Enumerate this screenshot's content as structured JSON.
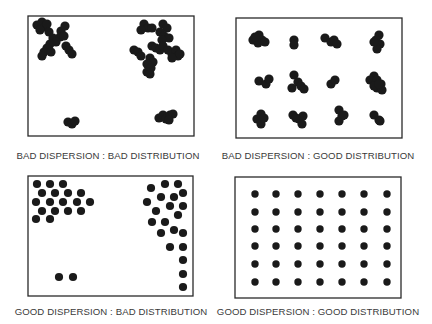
{
  "figure": {
    "colors": {
      "dot": "#1a1a1a",
      "frame": "#2a2a2a",
      "label": "#3a3a3a",
      "background": "#ffffff"
    },
    "panels": [
      {
        "id": "bad-dispersion-bad-distribution",
        "label": "BAD DISPERSION  :  BAD DISTRIBUTION",
        "label_pos": {
          "x": 108,
          "y": 150
        },
        "frame": {
          "x": 28,
          "y": 16,
          "w": 166,
          "h": 120
        },
        "dot_r": 4.6,
        "dots": [
          [
            37,
            25
          ],
          [
            42,
            22
          ],
          [
            45,
            27
          ],
          [
            40,
            30
          ],
          [
            47,
            24
          ],
          [
            49,
            32
          ],
          [
            61,
            31
          ],
          [
            65,
            26
          ],
          [
            60,
            37
          ],
          [
            64,
            36
          ],
          [
            53,
            38
          ],
          [
            56,
            42
          ],
          [
            50,
            44
          ],
          [
            47,
            48
          ],
          [
            44,
            52
          ],
          [
            51,
            52
          ],
          [
            42,
            56
          ],
          [
            66,
            46
          ],
          [
            69,
            50
          ],
          [
            72,
            54
          ],
          [
            144,
            24
          ],
          [
            148,
            28
          ],
          [
            152,
            28
          ],
          [
            141,
            30
          ],
          [
            163,
            24
          ],
          [
            167,
            28
          ],
          [
            160,
            32
          ],
          [
            164,
            36
          ],
          [
            169,
            38
          ],
          [
            162,
            40
          ],
          [
            134,
            50
          ],
          [
            138,
            52
          ],
          [
            141,
            56
          ],
          [
            152,
            46
          ],
          [
            156,
            48
          ],
          [
            160,
            50
          ],
          [
            163,
            46
          ],
          [
            168,
            50
          ],
          [
            172,
            54
          ],
          [
            176,
            50
          ],
          [
            178,
            56
          ],
          [
            172,
            58
          ],
          [
            180,
            54
          ],
          [
            150,
            58
          ],
          [
            153,
            62
          ],
          [
            147,
            64
          ],
          [
            151,
            68
          ],
          [
            147,
            72
          ],
          [
            150,
            74
          ],
          [
            68,
            122
          ],
          [
            72,
            124
          ],
          [
            75,
            121
          ],
          [
            159,
            118
          ],
          [
            163,
            115
          ],
          [
            166,
            119
          ],
          [
            170,
            115
          ],
          [
            173,
            114
          ],
          [
            169,
            120
          ]
        ]
      },
      {
        "id": "bad-dispersion-good-distribution",
        "label": "BAD DISPERSION  :  GOOD DISTRIBUTION",
        "label_pos": {
          "x": 318,
          "y": 150
        },
        "frame": {
          "x": 236,
          "y": 18,
          "w": 166,
          "h": 120
        },
        "dot_r": 4.6,
        "dots": [
          [
            253,
            40
          ],
          [
            259,
            35
          ],
          [
            262,
            40
          ],
          [
            258,
            43
          ],
          [
            255,
            37
          ],
          [
            265,
            42
          ],
          [
            294,
            40
          ],
          [
            294,
            45
          ],
          [
            325,
            38
          ],
          [
            331,
            42
          ],
          [
            334,
            40
          ],
          [
            337,
            44
          ],
          [
            379,
            35
          ],
          [
            376,
            40
          ],
          [
            380,
            44
          ],
          [
            377,
            49
          ],
          [
            374,
            42
          ],
          [
            259,
            81
          ],
          [
            266,
            84
          ],
          [
            269,
            79
          ],
          [
            294,
            75
          ],
          [
            298,
            82
          ],
          [
            292,
            88
          ],
          [
            301,
            86
          ],
          [
            304,
            89
          ],
          [
            331,
            84
          ],
          [
            335,
            80
          ],
          [
            374,
            76
          ],
          [
            370,
            80
          ],
          [
            377,
            80
          ],
          [
            381,
            84
          ],
          [
            377,
            88
          ],
          [
            382,
            90
          ],
          [
            374,
            86
          ],
          [
            379,
            84
          ],
          [
            257,
            119
          ],
          [
            261,
            114
          ],
          [
            261,
            124
          ],
          [
            264,
            118
          ],
          [
            293,
            115
          ],
          [
            299,
            119
          ],
          [
            303,
            116
          ],
          [
            302,
            124
          ],
          [
            296,
            118
          ],
          [
            339,
            110
          ],
          [
            342,
            116
          ],
          [
            339,
            121
          ],
          [
            344,
            115
          ],
          [
            374,
            115
          ],
          [
            379,
            120
          ],
          [
            380,
            121
          ]
        ]
      },
      {
        "id": "good-dispersion-bad-distribution",
        "label": "GOOD DISPERSION  :  BAD DISTRIBUTION",
        "label_pos": {
          "x": 111,
          "y": 306
        },
        "frame": {
          "x": 28,
          "y": 176,
          "w": 165,
          "h": 120
        },
        "dot_r": 4.1,
        "dots": [
          [
            37,
            184
          ],
          [
            50,
            184
          ],
          [
            63,
            184
          ],
          [
            42,
            193
          ],
          [
            55,
            193
          ],
          [
            68,
            193
          ],
          [
            81,
            193
          ],
          [
            36,
            202
          ],
          [
            50,
            202
          ],
          [
            63,
            202
          ],
          [
            77,
            202
          ],
          [
            90,
            202
          ],
          [
            42,
            211
          ],
          [
            55,
            211
          ],
          [
            68,
            211
          ],
          [
            81,
            211
          ],
          [
            36,
            219
          ],
          [
            50,
            219
          ],
          [
            165,
            184
          ],
          [
            178,
            184
          ],
          [
            151,
            188
          ],
          [
            183,
            193
          ],
          [
            161,
            197
          ],
          [
            174,
            197
          ],
          [
            147,
            202
          ],
          [
            170,
            206
          ],
          [
            183,
            206
          ],
          [
            156,
            211
          ],
          [
            178,
            215
          ],
          [
            152,
            222
          ],
          [
            165,
            222
          ],
          [
            161,
            233
          ],
          [
            174,
            230
          ],
          [
            183,
            233
          ],
          [
            170,
            247
          ],
          [
            183,
            247
          ],
          [
            183,
            260
          ],
          [
            183,
            274
          ],
          [
            183,
            287
          ],
          [
            59,
            277
          ],
          [
            73,
            277
          ]
        ]
      },
      {
        "id": "good-dispersion-good-distribution",
        "label": "GOOD DISPERSION  :  GOOD DISTRIBUTION",
        "label_pos": {
          "x": 318,
          "y": 306
        },
        "frame": {
          "x": 235,
          "y": 177,
          "w": 166,
          "h": 121
        },
        "dot_r": 3.7,
        "grid": {
          "cols": [
            255,
            276,
            298,
            320,
            342,
            364,
            387
          ],
          "rows": [
            194,
            212,
            229,
            246,
            264,
            282
          ]
        }
      }
    ]
  }
}
